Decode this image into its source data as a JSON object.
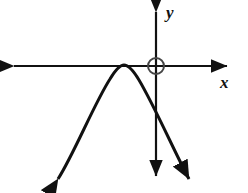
{
  "figure": {
    "kind": "cartesian-graph",
    "background_color": "#ffffff",
    "stroke_color": "#111111",
    "width": 248,
    "height": 193
  },
  "axes": {
    "x_axis": {
      "label": "x",
      "label_position": {
        "x": 220,
        "y": 74
      },
      "y_pixel": 66,
      "start_x": 8,
      "end_x": 233,
      "arrows": "both",
      "stroke_width": 2.2
    },
    "y_axis": {
      "label": "y",
      "label_position": {
        "x": 166,
        "y": 4
      },
      "x_pixel": 156,
      "start_y": 6,
      "end_y": 182,
      "arrows": "both",
      "stroke_width": 2.2
    },
    "origin": {
      "x": 156,
      "y": 66
    }
  },
  "markers": [
    {
      "name": "origin-circle",
      "shape": "circle",
      "cx": 156,
      "cy": 66,
      "r": 8,
      "fill": "none",
      "stroke": "#444444",
      "stroke_width": 2
    }
  ],
  "chart_data": {
    "type": "line",
    "title": "",
    "xlabel": "x",
    "ylabel": "y",
    "grid": false,
    "legend": null,
    "curves": [
      {
        "name": "downward-parabola",
        "description": "Downward-opening parabola tangent to the x-axis, vertex left of the y-axis, arrows on both arms",
        "opens": "down",
        "vertex_pixel": {
          "x": 124,
          "y": 65
        },
        "y_intercept_pixel": {
          "x": 156,
          "y": 95
        },
        "x_intercepts_pixel": [
          {
            "x": 124,
            "y": 66
          }
        ],
        "arrow_ends_pixel": [
          {
            "x": 58,
            "y": 179
          },
          {
            "x": 189,
            "y": 179
          }
        ],
        "stroke": "#111111",
        "stroke_width": 3,
        "path": "M 58 179 C 74 154, 94 104, 110 79 C 116 69, 120 65, 124 65 C 128 65, 133 70, 139 80 C 155 107, 175 153, 189 179"
      }
    ]
  }
}
